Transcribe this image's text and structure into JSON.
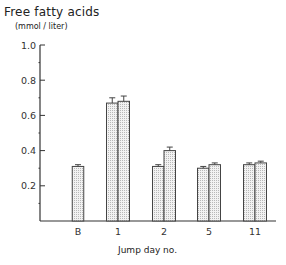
{
  "title": "Free fatty acids",
  "units": "(mmol / liter)",
  "xlabel": "Jump day no.",
  "colors": {
    "bar_fill": "#ececec",
    "bar_stroke": "#444444",
    "axis": "#333333"
  },
  "chart_data": {
    "type": "bar",
    "title": "Free fatty acids",
    "ylabel": "(mmol / liter)",
    "xlabel": "Jump day no.",
    "categories": [
      "B",
      "1",
      "2",
      "5",
      "11"
    ],
    "series": [
      {
        "name": "bar 1",
        "values": [
          0.31,
          0.67,
          0.31,
          0.3,
          0.32
        ],
        "errors": [
          0.01,
          0.03,
          0.01,
          0.01,
          0.01
        ]
      },
      {
        "name": "bar 2",
        "values": [
          null,
          0.68,
          0.4,
          0.32,
          0.33
        ],
        "errors": [
          null,
          0.03,
          0.02,
          0.01,
          0.01
        ]
      }
    ],
    "ylim": [
      0,
      1.0
    ],
    "yticks": [
      0.2,
      0.4,
      0.6,
      0.8,
      1.0
    ],
    "ytick_labels": [
      "0.2",
      "0.4",
      "0.6",
      "0.8",
      "1.0"
    ],
    "grid": false,
    "legend": null
  }
}
